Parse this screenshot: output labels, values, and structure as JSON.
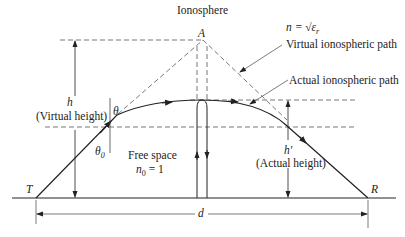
{
  "diagram": {
    "title": "Ionosphere",
    "apex_label": "A",
    "refractive_index": "n = √ε",
    "refractive_index_sub": "r",
    "virtual_path_label": "Virtual ionospheric path",
    "actual_path_label": "Actual ionospheric path",
    "virtual_height_symbol": "h",
    "virtual_height_label": "(Virtual height)",
    "theta_label": "θ",
    "theta0_label": "θ",
    "theta0_sub": "0",
    "free_space_label": "Free space",
    "n0_label": "n",
    "n0_sub": "0",
    "n0_value": " = 1",
    "actual_height_symbol": "h′",
    "actual_height_label": "(Actual height)",
    "transmitter_label": "T",
    "receiver_label": "R",
    "distance_label": "d",
    "colors": {
      "line": "#222222",
      "dashed": "#555555",
      "background": "#ffffff"
    }
  }
}
